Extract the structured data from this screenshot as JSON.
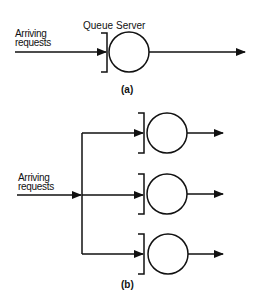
{
  "diagram": {
    "a": {
      "caption": "(a)",
      "input_label": "Arriving\nrequests",
      "queue_label": "Queue",
      "server_label": "Server"
    },
    "b": {
      "caption": "(b)",
      "input_label": "Arriving\nrequests",
      "server_count": 3
    },
    "colors": {
      "stroke": "#111111",
      "background": "#ffffff"
    }
  }
}
